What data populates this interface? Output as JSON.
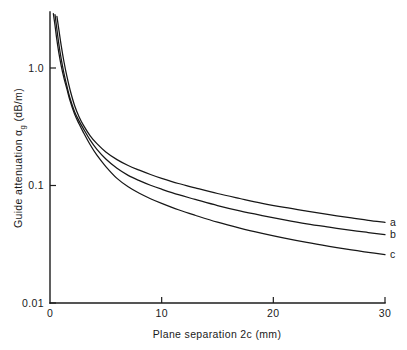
{
  "chart_data": {
    "type": "line",
    "title": "",
    "xlabel": "Plane separation 2c (mm)",
    "ylabel": "Guide attenuation αg (dB/m)",
    "ylabel_main": "Guide attenuation",
    "ylabel_symbol": "α",
    "ylabel_subscript": "g",
    "ylabel_units": "(dB/m)",
    "xscale": "linear",
    "yscale": "log",
    "xlim": [
      0,
      30
    ],
    "ylim": [
      0.01,
      3.0
    ],
    "grid": false,
    "legend_position": "right-inline",
    "xticks": [
      0,
      10,
      20,
      30
    ],
    "xticklabels": [
      "0",
      "10",
      "20",
      "30"
    ],
    "yticks": [
      1.0,
      0.1,
      0.01
    ],
    "yticklabels": [
      "1.0",
      "0.1",
      "0.01"
    ],
    "series": [
      {
        "name": "a",
        "label": "a",
        "x": [
          0.62,
          0.8,
          1.0,
          1.25,
          1.5,
          1.8,
          2.2,
          2.6,
          3.0,
          3.6,
          4.2,
          5.0,
          6.0,
          7.0,
          8.0,
          9.0,
          10.0,
          11.5,
          13.0,
          15.0,
          17.0,
          19.0,
          21.0,
          23.0,
          25.0,
          27.0,
          28.5,
          30.0
        ],
        "y": [
          2.75,
          2.1,
          1.56,
          1.13,
          0.86,
          0.65,
          0.48,
          0.385,
          0.325,
          0.265,
          0.227,
          0.193,
          0.166,
          0.148,
          0.135,
          0.124,
          0.115,
          0.104,
          0.0955,
          0.0855,
          0.0775,
          0.0705,
          0.065,
          0.0605,
          0.0565,
          0.053,
          0.0505,
          0.0485
        ]
      },
      {
        "name": "b",
        "label": "b",
        "x": [
          0.45,
          0.6,
          0.78,
          1.0,
          1.25,
          1.5,
          1.8,
          2.2,
          2.6,
          3.0,
          3.6,
          4.2,
          5.0,
          6.0,
          7.0,
          8.0,
          9.0,
          10.0,
          11.5,
          13.0,
          15.0,
          17.0,
          19.0,
          21.0,
          23.0,
          25.0,
          27.0,
          28.5,
          30.0
        ],
        "y": [
          2.85,
          2.2,
          1.63,
          1.2,
          0.9,
          0.71,
          0.55,
          0.425,
          0.355,
          0.303,
          0.243,
          0.203,
          0.168,
          0.14,
          0.122,
          0.11,
          0.1005,
          0.093,
          0.0835,
          0.0762,
          0.0675,
          0.0608,
          0.0555,
          0.051,
          0.0472,
          0.0442,
          0.0415,
          0.0398,
          0.0382
        ]
      },
      {
        "name": "c",
        "label": "c",
        "x": [
          0.3,
          0.45,
          0.6,
          0.8,
          1.0,
          1.25,
          1.5,
          1.8,
          2.2,
          2.6,
          3.0,
          3.6,
          4.2,
          5.0,
          6.0,
          7.0,
          8.0,
          9.0,
          10.0,
          11.5,
          13.0,
          15.0,
          17.0,
          19.0,
          21.0,
          23.0,
          25.0,
          27.0,
          28.5,
          30.0
        ],
        "y": [
          2.9,
          2.3,
          1.78,
          1.33,
          1.05,
          0.82,
          0.67,
          0.525,
          0.405,
          0.335,
          0.282,
          0.222,
          0.181,
          0.145,
          0.115,
          0.0975,
          0.0858,
          0.0772,
          0.0705,
          0.0622,
          0.0558,
          0.0487,
          0.0434,
          0.0392,
          0.0357,
          0.0328,
          0.0304,
          0.0283,
          0.027,
          0.0258
        ]
      }
    ]
  },
  "geometry": {
    "plot_left": 50,
    "plot_right": 385,
    "plot_top": 12,
    "plot_bottom": 303,
    "y_decade_px": 117.5,
    "y_pos_1p0": 68,
    "y_pos_0p1": 185.5,
    "y_pos_0p01": 303
  }
}
